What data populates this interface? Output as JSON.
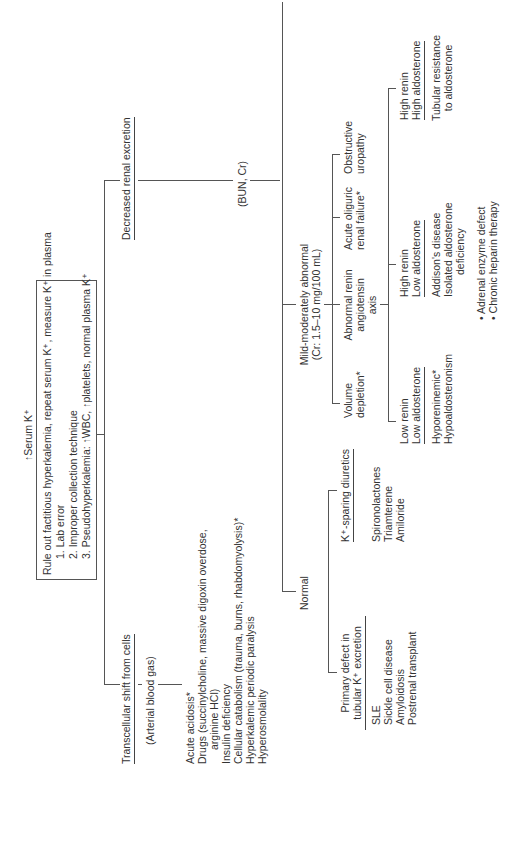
{
  "title": "↑Serum K⁺",
  "rule_out": {
    "heading": "Rule out factitious hyperkalemia, repeat serum K⁺, measure K⁺ in plasma",
    "items": [
      "1.  Lab error",
      "2.  Improper collection technique",
      "3.  Pseudohyperkalemia: ↑WBC, ↑platelets, normal plasma K⁺"
    ]
  },
  "transcellular": {
    "label": "Transcellular shift from cells",
    "test": "(Arterial blood gas)",
    "causes": [
      "Acute acidosis*",
      "Drugs (succinylcholine, massive digoxin overdose,",
      "   arginine HCl)",
      "Insulin deficiency",
      "Cellular catabolism (trauma, burns, rhabdomyolysis)*",
      "Hyperkalemic periodic paralysis",
      "Hyperosmolality"
    ]
  },
  "renal": {
    "label": "Decreased renal excretion",
    "test": "(BUN, Cr)",
    "normal": {
      "label": "Normal",
      "primary_defect": {
        "label_lines": [
          "Primary defect in",
          "tubular K⁺ excretion"
        ],
        "causes": [
          "SLE",
          "Sickle cell disease",
          "Amyloidosis",
          "Postrenal transplant"
        ]
      },
      "k_sparing": {
        "label": "K⁺-sparing diuretics",
        "causes": [
          "Spironolactones",
          "Triamterene",
          "Amiloride"
        ]
      }
    },
    "mild": {
      "label_lines": [
        "Mild-moderately abnormal",
        "(Cr: 1.5–10 mg/100 mL)"
      ],
      "volume": [
        "Volume",
        "depletion*"
      ],
      "renin_axis": {
        "label_lines": [
          "Abnormal renin",
          "angiotensin",
          "axis"
        ],
        "low_low": {
          "label_lines": [
            "Low renin",
            "Low aldosterone"
          ],
          "causes": [
            "Hyporeninemic*",
            "Hypoaldosteronism"
          ]
        },
        "high_low": {
          "label_lines": [
            "High renin",
            "Low aldosterone"
          ],
          "causes": [
            "Addison's disease",
            "Isolated aldosterone",
            "deficiency"
          ],
          "sub": [
            "• Adrenal enzyme defect",
            "• Chronic heparin therapy"
          ]
        },
        "high_high": {
          "label_lines": [
            "High renin",
            "High aldosterone"
          ],
          "causes": [
            "Tubular resistance",
            "to aldosterone"
          ]
        }
      },
      "acute_oliguric": [
        "Acute oliguric",
        "renal failure*"
      ],
      "obstructive": [
        "Obstructive",
        "uropathy"
      ]
    },
    "severe": {
      "label_lines": [
        "Severely abnormal",
        "(Cr > 10 mg/100 mL)"
      ],
      "renal_failure": "*Renal failure",
      "acute": "Acute",
      "chronic": "Chronic",
      "oliguric": "Oliguric",
      "non_oliguric": "Non-oliguric",
      "non_oliguric_causes": [
        "↑K⁺intake,",
        "transcellular",
        "shift from cells"
      ]
    }
  },
  "footnote": "* Common in surgical patients."
}
